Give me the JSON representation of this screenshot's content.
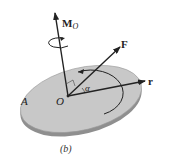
{
  "figure": {
    "caption": "(b)",
    "labels": {
      "moment": "M",
      "moment_subscript": "O",
      "force": "F",
      "position": "r",
      "origin": "O",
      "area": "A",
      "angle": "α"
    },
    "colors": {
      "disk_top": "#c8c8c8",
      "disk_edge": "#8f8f8f",
      "line": "#222222",
      "background": "#ffffff"
    }
  }
}
